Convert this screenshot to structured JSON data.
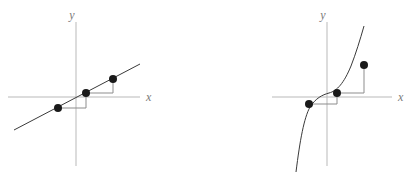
{
  "figure": {
    "width": 418,
    "height": 179,
    "background": "#ffffff",
    "panel_count": 2
  },
  "colors": {
    "axis": "#b9b9b9",
    "curve": "#3a3a3a",
    "stair": "#8d8d8d",
    "point": "#1a1a1a",
    "label": "#7a7a7a"
  },
  "panels": [
    {
      "id": "left",
      "function_type": "linear",
      "axes": {
        "x_label": "x",
        "y_label": "y",
        "origin": {
          "x": 76,
          "y": 97
        },
        "x_axis": {
          "x1": 8,
          "y1": 97,
          "x2": 140,
          "y2": 97
        },
        "y_axis": {
          "x1": 76,
          "y1": 22,
          "x2": 76,
          "y2": 166
        },
        "x_label_pos": {
          "x": 146,
          "y": 101
        },
        "y_label_pos": {
          "x": 72,
          "y": 19
        }
      },
      "curve": {
        "kind": "line",
        "x1": 14,
        "y1": 130,
        "x2": 140,
        "y2": 64
      },
      "points": [
        {
          "x": 58,
          "y": 108,
          "r": 4
        },
        {
          "x": 86,
          "y": 93,
          "r": 4
        },
        {
          "x": 113,
          "y": 79,
          "r": 4
        }
      ],
      "staircase": {
        "path": "M 58 108 L 86 108 L 86 93 L 113 93 L 113 79",
        "description": "constant rise over constant run"
      }
    },
    {
      "id": "right",
      "function_type": "cubic",
      "axes": {
        "x_label": "x",
        "y_label": "y",
        "origin": {
          "x": 327,
          "y": 97
        },
        "x_axis": {
          "x1": 272,
          "y1": 97,
          "x2": 392,
          "y2": 97
        },
        "y_axis": {
          "x1": 327,
          "y1": 22,
          "x2": 327,
          "y2": 166
        },
        "x_label_pos": {
          "x": 398,
          "y": 101
        },
        "y_label_pos": {
          "x": 323,
          "y": 19
        }
      },
      "curve": {
        "kind": "cubic",
        "path": "M 296 172 C 300 140 304 118 310 107 C 316 98 322 95 329 93 C 337 91 344 83 351 66 C 356 53 360 40 364 26"
      },
      "points": [
        {
          "x": 309,
          "y": 104,
          "r": 4
        },
        {
          "x": 337,
          "y": 93,
          "r": 4
        },
        {
          "x": 364,
          "y": 65,
          "r": 4
        }
      ],
      "staircase": {
        "path": "M 309 104 L 337 104 L 337 93 L 364 93 L 364 65",
        "description": "constant run with increasing rise"
      }
    }
  ]
}
